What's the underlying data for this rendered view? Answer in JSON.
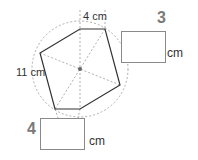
{
  "diagram": {
    "labels": {
      "top_side": "4 cm",
      "left_side": "11 cm"
    },
    "questions": [
      {
        "number": "3",
        "unit": "cm"
      },
      {
        "number": "4",
        "unit": "cm"
      }
    ]
  }
}
